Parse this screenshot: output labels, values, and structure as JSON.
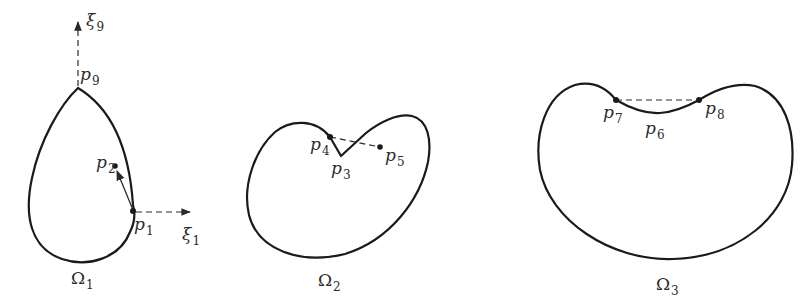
{
  "figure": {
    "shapes": [
      {
        "id": "omega1",
        "label": "Ω",
        "label_sub": "1",
        "description": "teardrop-shaped domain with corner at top",
        "points": [
          {
            "name": "p",
            "sub": "9",
            "role": "corner vertex at top"
          },
          {
            "name": "p",
            "sub": "1",
            "role": "boundary point on right side"
          },
          {
            "name": "p",
            "sub": "2",
            "role": "interior point"
          }
        ],
        "axes": [
          {
            "name": "ξ",
            "sub": "9",
            "direction": "up"
          },
          {
            "name": "ξ",
            "sub": "1",
            "direction": "right"
          }
        ]
      },
      {
        "id": "omega2",
        "label": "Ω",
        "label_sub": "2",
        "description": "domain with inward notch (re-entrant corner)",
        "points": [
          {
            "name": "p",
            "sub": "4",
            "role": "boundary point left of notch"
          },
          {
            "name": "p",
            "sub": "3",
            "role": "notch vertex"
          },
          {
            "name": "p",
            "sub": "5",
            "role": "interior point joined to p4 by dashed line"
          }
        ]
      },
      {
        "id": "omega3",
        "label": "Ω",
        "label_sub": "3",
        "description": "kidney-shaped domain with concave top",
        "points": [
          {
            "name": "p",
            "sub": "7",
            "role": "left end of concave segment"
          },
          {
            "name": "p",
            "sub": "6",
            "role": "point on concave segment"
          },
          {
            "name": "p",
            "sub": "8",
            "role": "right end of concave segment"
          }
        ]
      }
    ],
    "colors": {
      "stroke": "#1a1a1a",
      "background": "#ffffff"
    }
  }
}
